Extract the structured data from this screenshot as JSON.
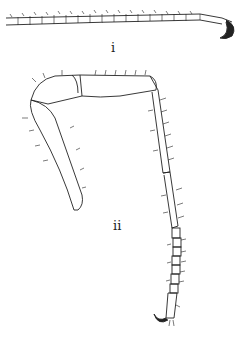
{
  "figure": {
    "panels": [
      {
        "id": "i",
        "label": "i",
        "description": "segmented appendage with terminal claw"
      },
      {
        "id": "ii",
        "label": "ii",
        "description": "jointed leg with coxa, femur, tibia and segmented tarsus ending in claw"
      }
    ],
    "colors": {
      "ink": "#222222",
      "background": "#ffffff"
    }
  }
}
